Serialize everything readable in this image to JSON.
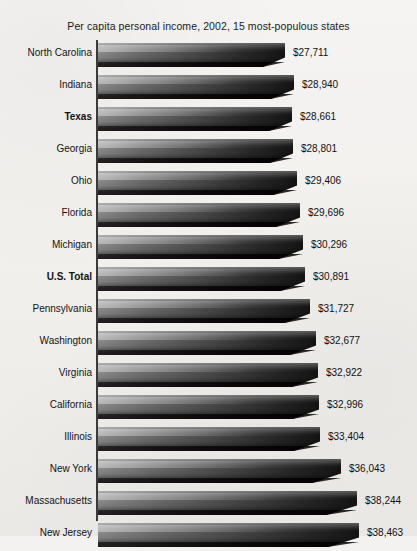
{
  "chart_data": {
    "type": "bar",
    "orientation": "horizontal",
    "title": "Per capita personal income, 2002, 15 most-populous states",
    "xlabel": "",
    "ylabel": "",
    "grid": false,
    "legend": "none",
    "categories": [
      "North Carolina",
      "Indiana",
      "Texas",
      "Georgia",
      "Ohio",
      "Florida",
      "Michigan",
      "U.S. Total",
      "Pennsylvania",
      "Washington",
      "Virginia",
      "California",
      "Illinois",
      "New York",
      "Massachusetts",
      "New Jersey"
    ],
    "values": [
      27711,
      28940,
      28661,
      28801,
      29406,
      29696,
      30296,
      30891,
      31727,
      32677,
      32922,
      32996,
      33404,
      36043,
      38244,
      38463
    ],
    "value_labels": [
      "$27,711",
      "$28,940",
      "$28,661",
      "$28,801",
      "$29,406",
      "$29,696",
      "$30,296",
      "$30,891",
      "$31,727",
      "$32,677",
      "$32,922",
      "$32,996",
      "$33,404",
      "$36,043",
      "$38,244",
      "$38,463"
    ],
    "emphasized_categories": [
      "Texas",
      "U.S. Total"
    ],
    "bar_pixel_lengths": [
      187,
      196,
      194,
      195,
      199,
      202,
      205,
      207,
      212,
      218,
      220,
      221,
      222,
      243,
      259,
      261
    ],
    "axis_origin_value": 0,
    "note": "Bar lengths are visually truncated; lengths shown are as rendered in the source figure."
  },
  "colors": {
    "background": "#f3f2f0",
    "bar_light": "#8e8e8e",
    "bar_dark": "#141414",
    "axis": "#3a3a3a",
    "text": "#131313"
  }
}
